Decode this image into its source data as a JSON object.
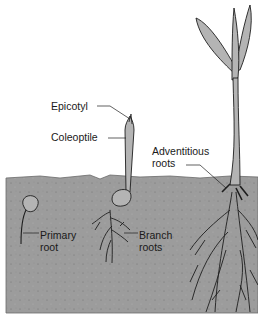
{
  "figure": {
    "labels": {
      "epicotyl": "Epicotyl",
      "coleoptile": "Coleoptile",
      "adventitious_roots": [
        "Adventitious",
        "roots"
      ],
      "primary_root": [
        "Primary",
        "root"
      ],
      "branch_roots": [
        "Branch",
        "roots"
      ]
    },
    "stages": [
      "early-germination",
      "coleoptile-emergence",
      "mature-seedling"
    ],
    "colors": {
      "soil": "#9c9c9c",
      "plant_fill": "#b4b4b4",
      "outline": "#1e1e1e",
      "background": "#ffffff"
    }
  }
}
